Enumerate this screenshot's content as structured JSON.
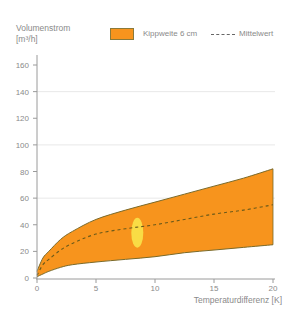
{
  "chart_data": {
    "type": "area",
    "title": "",
    "ylabel": "Volumenstrom [m³/h]",
    "xlabel": "Temperaturdifferenz [K]",
    "xlim": [
      0,
      20
    ],
    "ylim": [
      0,
      160
    ],
    "x_ticks": [
      0,
      5,
      10,
      15,
      20
    ],
    "y_ticks": [
      0,
      20,
      40,
      60,
      80,
      100,
      120,
      140,
      160
    ],
    "gridlines_y": [
      60,
      100,
      140
    ],
    "legend_position": "top",
    "x": [
      0,
      0.5,
      1,
      2,
      3,
      5,
      7.5,
      10,
      12.5,
      15,
      17.5,
      20
    ],
    "series": [
      {
        "name": "Kippweite 6 cm (obere Grenze)",
        "values": [
          5,
          15,
          20,
          29,
          35,
          44,
          51,
          57,
          63,
          69,
          75,
          82
        ]
      },
      {
        "name": "Mittelwert",
        "values": [
          2,
          10,
          14,
          21,
          26,
          33,
          37,
          40,
          44,
          48,
          51,
          55
        ]
      },
      {
        "name": "Kippweite 6 cm (untere Grenze)",
        "values": [
          1,
          3,
          5,
          8,
          10,
          12,
          14,
          16,
          19,
          21,
          23,
          25
        ]
      }
    ],
    "annotation": {
      "type": "highlight-ellipse",
      "x": 8.5,
      "y": 34,
      "color": "#f8e34a"
    }
  },
  "labels": {
    "ylabel_line1": "Volumenstrom",
    "ylabel_line2": "[m³/h]",
    "legend_band": "Kippweite 6 cm",
    "legend_mean": "Mittelwert",
    "xlabel": "Temperaturdifferenz [K]"
  },
  "colors": {
    "band_fill": "#f7941d",
    "band_stroke": "#7a6a2a",
    "mean_line": "#6b5a1a",
    "highlight": "#f8e34a",
    "axis": "#9a9a9a",
    "grid": "#e8e8e8"
  }
}
